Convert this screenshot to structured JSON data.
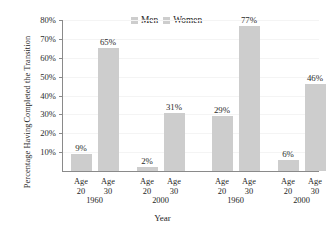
{
  "chart_data": {
    "type": "bar",
    "title": "",
    "xlabel": "Year",
    "ylabel_line1": "Percentage Having",
    "ylabel_line2": "Completed the Transition",
    "ylim": [
      0,
      80
    ],
    "ytick_labels": [
      "10%",
      "20%",
      "30%",
      "40%",
      "50%",
      "60%",
      "70%",
      "80%"
    ],
    "ytick_values": [
      10,
      20,
      30,
      40,
      50,
      60,
      70,
      80
    ],
    "grid": true,
    "legend_position": "top-center",
    "legend": [
      "Men",
      "Women"
    ],
    "categories": [
      "Age 20",
      "Age 30",
      "Age 20",
      "Age 30",
      "Age 20",
      "Age 30",
      "Age 20",
      "Age 30"
    ],
    "group_labels": [
      "1960",
      "2000",
      "1960",
      "2000"
    ],
    "series": [
      {
        "name": "Men",
        "groups": [
          {
            "year": "1960",
            "points": [
              {
                "age": "Age 20",
                "value": 9,
                "label": "9%"
              },
              {
                "age": "Age 30",
                "value": 65,
                "label": "65%"
              }
            ]
          },
          {
            "year": "2000",
            "points": [
              {
                "age": "Age 20",
                "value": 2,
                "label": "2%"
              },
              {
                "age": "Age 30",
                "value": 31,
                "label": "31%"
              }
            ]
          }
        ]
      },
      {
        "name": "Women",
        "groups": [
          {
            "year": "1960",
            "points": [
              {
                "age": "Age 20",
                "value": 29,
                "label": "29%"
              },
              {
                "age": "Age 30",
                "value": 77,
                "label": "77%"
              }
            ]
          },
          {
            "year": "2000",
            "points": [
              {
                "age": "Age 20",
                "value": 6,
                "label": "6%"
              },
              {
                "age": "Age 30",
                "value": 46,
                "label": "46%"
              }
            ]
          }
        ]
      }
    ],
    "values": [
      9,
      65,
      2,
      31,
      29,
      77,
      6,
      46
    ],
    "value_labels": [
      "9%",
      "65%",
      "2%",
      "31%",
      "29%",
      "77%",
      "6%",
      "46%"
    ],
    "bar_color": "#cdcdcd",
    "axis_color": "#8a8a8a",
    "grid_color": "#f4f4f4",
    "text_color": "#262626"
  },
  "axis": {
    "y_title_line1": "Percentage Having",
    "y_title_line2": "Completed the Transition",
    "x_title": "Year"
  },
  "legend": {
    "men": "Men",
    "women": "Women"
  },
  "xaxis": {
    "age_labels": [
      "Age",
      "Age",
      "Age",
      "Age",
      "Age",
      "Age",
      "Age",
      "Age"
    ],
    "age_numbers": [
      "20",
      "30",
      "20",
      "30",
      "20",
      "30",
      "20",
      "30"
    ],
    "years": [
      "1960",
      "2000",
      "1960",
      "2000"
    ]
  }
}
